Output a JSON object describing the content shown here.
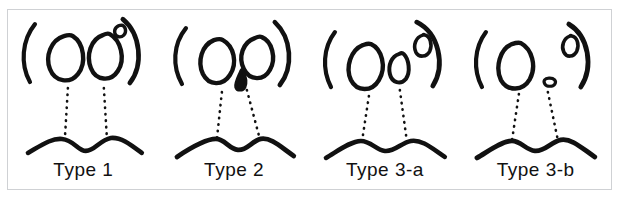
{
  "figure": {
    "caption_artifact": "",
    "stroke_color": "#111111",
    "frame_border_color": "#cfd1d4",
    "background_color": "#ffffff"
  },
  "panels": [
    {
      "id": "type-1",
      "label": "Type 1",
      "description": "Two large ovals and one small round opening at upper right, inside parentheses, above a smoothly curved wavy line",
      "openings": [
        {
          "name": "left-large-oval",
          "shape": "oval",
          "size": "large"
        },
        {
          "name": "right-large-oval",
          "shape": "oval",
          "size": "large"
        },
        {
          "name": "upper-right-small-circle",
          "shape": "circle",
          "size": "small"
        }
      ],
      "lip_style": "rounded-wave",
      "dotted_guides": 2
    },
    {
      "id": "type-2",
      "label": "Type 2",
      "description": "Two large ovals with a small filled teardrop between and below them, inside parentheses, above an angular wavy line",
      "openings": [
        {
          "name": "left-large-oval",
          "shape": "oval",
          "size": "large"
        },
        {
          "name": "right-large-oval",
          "shape": "oval",
          "size": "large"
        },
        {
          "name": "center-teardrop",
          "shape": "teardrop",
          "size": "tiny"
        }
      ],
      "lip_style": "angular-wave",
      "dotted_guides": 2
    },
    {
      "id": "type-3-a",
      "label": "Type 3-a",
      "description": "One large oval at left, one medium narrow oval at centre, one small oval at upper right, inside parentheses, above a wavy line",
      "openings": [
        {
          "name": "left-large-oval",
          "shape": "oval",
          "size": "large"
        },
        {
          "name": "center-medium-oval",
          "shape": "oval",
          "size": "medium"
        },
        {
          "name": "upper-right-small-oval",
          "shape": "oval",
          "size": "small"
        }
      ],
      "lip_style": "rounded-wave",
      "dotted_guides": 2
    },
    {
      "id": "type-3-b",
      "label": "Type 3-b",
      "description": "One large oval at left, one very small flat oval at centre low, one small oval at upper right, inside parentheses, above a wavy line",
      "openings": [
        {
          "name": "left-large-oval",
          "shape": "oval",
          "size": "large"
        },
        {
          "name": "center-tiny-oval",
          "shape": "oval",
          "size": "tiny"
        },
        {
          "name": "upper-right-small-oval",
          "shape": "oval",
          "size": "small"
        }
      ],
      "lip_style": "angular-wave",
      "dotted_guides": 2
    }
  ]
}
